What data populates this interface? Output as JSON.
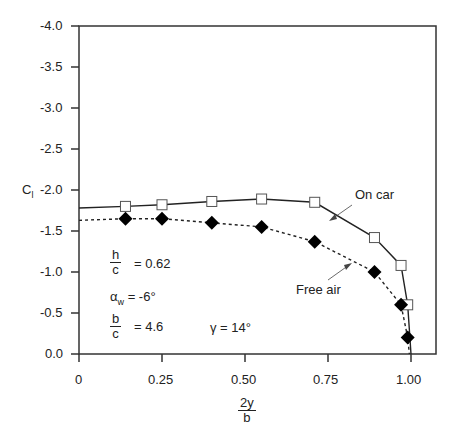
{
  "chart_data": {
    "type": "line",
    "title": "",
    "xlabel": "2y/b",
    "xlabel_num": "2y",
    "xlabel_den": "b",
    "ylabel": "C_l",
    "ylabel_main": "C",
    "ylabel_sub": "l",
    "xlim": [
      0,
      1.05
    ],
    "ylim": [
      0.0,
      -4.0
    ],
    "y_inverted": true,
    "grid": false,
    "xticks": [
      "0",
      "0.25",
      "0.50",
      "0.75",
      "1.00"
    ],
    "yticks": [
      "-4.0",
      "-3.5",
      "-3.0",
      "-2.5",
      "-2.0",
      "-1.5",
      "-1.0",
      "-0.5",
      "0.0"
    ],
    "series": [
      {
        "name": "On car",
        "marker": "open-square",
        "line": "solid",
        "x": [
          0.14,
          0.25,
          0.4,
          0.55,
          0.71,
          0.89,
          0.97,
          0.99
        ],
        "y": [
          -1.8,
          -1.82,
          -1.86,
          -1.89,
          -1.85,
          -1.42,
          -1.08,
          -0.6
        ]
      },
      {
        "name": "Free air",
        "marker": "filled-diamond",
        "line": "dashed",
        "x": [
          0.14,
          0.25,
          0.4,
          0.55,
          0.71,
          0.89,
          0.97,
          0.99
        ],
        "y": [
          -1.65,
          -1.65,
          -1.6,
          -1.55,
          -1.37,
          -1.0,
          -0.6,
          -0.2
        ]
      }
    ],
    "annotations": [
      {
        "text": "On car",
        "arrow": true
      },
      {
        "text": "Free air",
        "arrow": true
      },
      {
        "text": "h/c = 0.62"
      },
      {
        "text": "α_w = -6°"
      },
      {
        "text": "b/c = 4.6"
      },
      {
        "text": "γ = 14°"
      }
    ]
  },
  "labels": {
    "on_car": "On car",
    "free_air": "Free air",
    "h": "h",
    "c": "c",
    "hc_val": "= 0.62",
    "alpha": "α",
    "alpha_sub": "w",
    "alpha_val": "= -6°",
    "b": "b",
    "bc_val": "= 4.6",
    "gamma": "γ = 14°",
    "x0": "0",
    "x1": "0.25",
    "x2": "0.50",
    "x3": "0.75",
    "x4": "1.00",
    "y0": "-4.0",
    "y1": "-3.5",
    "y2": "-3.0",
    "y3": "-2.5",
    "y4": "-2.0",
    "y5": "-1.5",
    "y6": "-1.0",
    "y7": "-0.5",
    "y8": "0.0",
    "xnum": "2y",
    "xden": "b",
    "ylab": "C",
    "ylab_sub": "l"
  }
}
